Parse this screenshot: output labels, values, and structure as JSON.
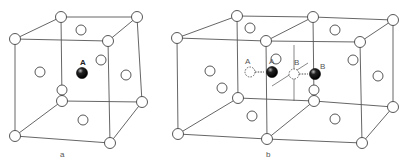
{
  "figure": {
    "panel_a": {
      "caption": "a",
      "atom_label": "A",
      "description": "Face-centered cubic unit cell with interstitial atom A at body center"
    },
    "panel_b": {
      "caption": "b",
      "labels": {
        "a_original": "A",
        "a_moved": "A",
        "b_original": "B",
        "b_moved": "B"
      },
      "description": "Two adjacent FCC unit cells showing interstitial atoms A and B shifting positions"
    },
    "colors": {
      "line": "#555555",
      "lattice_atom_fill": "#ffffff",
      "interstitial_atom_fill": "#111111",
      "background": "#ffffff"
    }
  }
}
